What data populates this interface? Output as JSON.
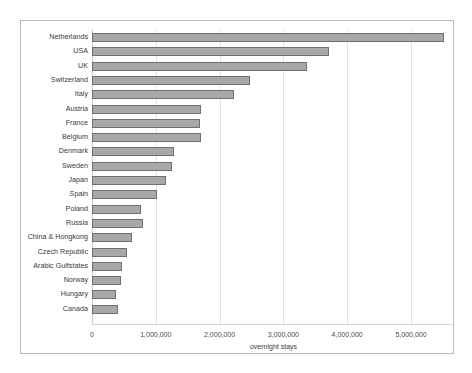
{
  "chart_data": {
    "type": "bar",
    "orientation": "horizontal",
    "title": "",
    "xlabel": "overnight stays",
    "ylabel": "",
    "xlim": [
      0,
      5520000
    ],
    "grid": true,
    "legend": false,
    "xticks": [
      0,
      1000000,
      2000000,
      3000000,
      4000000,
      5000000
    ],
    "xtick_labels": [
      "0",
      "1,000,000",
      "2,000,000",
      "3,000,000",
      "4,000,000",
      "5,000,000"
    ],
    "categories": [
      "Netherlands",
      "USA",
      "UK",
      "Switzerland",
      "Italy",
      "Austria",
      "France",
      "Belgium",
      "Denmark",
      "Sweden",
      "Japan",
      "Spain",
      "Poland",
      "Russia",
      "China & Hongkong",
      "Czech Republic",
      "Arabic Gulfstates",
      "Norway",
      "Hungary",
      "Canada"
    ],
    "values": [
      5520000,
      3710000,
      3370000,
      2480000,
      2230000,
      1710000,
      1690000,
      1710000,
      1290000,
      1250000,
      1160000,
      1020000,
      770000,
      800000,
      630000,
      550000,
      470000,
      450000,
      380000,
      400000
    ],
    "colors": {
      "bar_fill": "#a8a8a8",
      "bar_border": "#6f6f6f",
      "grid": "#e2e2e2",
      "frame": "#b9b9b9",
      "text": "#3a3a3a",
      "background": "#ffffff"
    }
  }
}
